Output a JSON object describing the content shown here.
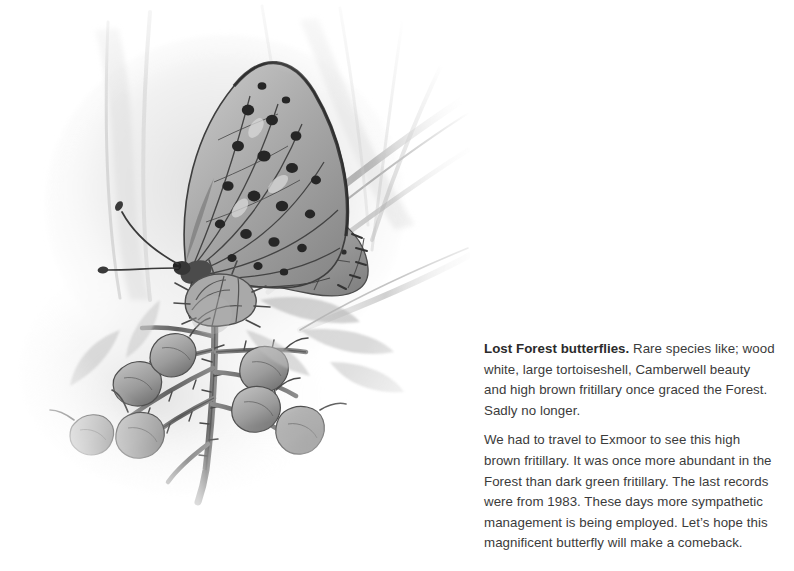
{
  "page": {
    "background_color": "#ffffff",
    "width": 794,
    "height": 571
  },
  "illustration": {
    "name": "high-brown-fritillary-butterfly-pencil-illustration",
    "subject": "High brown fritillary butterfly perched on a thistle flower head with seed buds and grass blades",
    "medium": "graphite pencil and grey wash drawing",
    "palette": {
      "paper": "#ffffff",
      "light_wash": "#e8e8e8",
      "mid_grey": "#9a9a9a",
      "dark_grey": "#5a5a5a",
      "darkest": "#262626"
    },
    "elements": {
      "butterfly": "fritillary with spotted forewing, silver-spotted hindwing underside, two clubbed antennae",
      "flower": "thistle-like flower head beneath the butterfly",
      "buds": "cluster of eight rounded seed buds on a thorny stem",
      "grass": "diagonal grass blades crossing the upper right"
    }
  },
  "caption": {
    "paragraphs": [
      {
        "lead": "Lost Forest butterflies.",
        "body": " Rare species like; wood white, large tortoiseshell, Camberwell beauty and high brown fritillary once graced the Forest. Sadly no longer."
      },
      {
        "lead": "",
        "body": "We had to travel to Exmoor to see this high brown fritillary. It was once more abundant in the Forest than dark green fritillary. The last records were from 1983. These days more sympathetic management is being employed. Let’s hope this magnificent butterfly will make a comeback."
      }
    ],
    "text_color": "#3b3b3b",
    "lead_color": "#2b2b2b"
  }
}
